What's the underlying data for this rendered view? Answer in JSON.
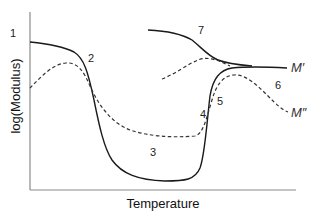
{
  "diagram": {
    "xlabel": "Temperature",
    "ylabel": "log(Modulus)",
    "curve_labels": {
      "m_prime": "M′",
      "m_double_prime": "M″"
    },
    "region_labels": [
      "1",
      "2",
      "3",
      "4",
      "5",
      "6",
      "7"
    ],
    "colors": {
      "axis": "#8a8a8a",
      "solid_curve": "#1a1a1a",
      "dashed_curve": "#333333"
    }
  }
}
